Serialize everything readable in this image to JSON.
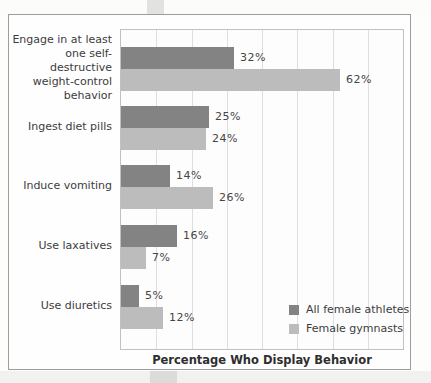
{
  "chart_data": {
    "type": "bar",
    "orientation": "horizontal",
    "xlabel": "Percentage Who Display Behavior",
    "xlim": [
      0,
      80
    ],
    "gridline_interval": 10,
    "grid": true,
    "legend_position": "bottom-right",
    "value_suffix": "%",
    "categories": [
      "Engage in at least one self-destructive weight-control behavior",
      "Ingest diet pills",
      "Induce vomiting",
      "Use laxatives",
      "Use diuretics"
    ],
    "category_lines": [
      [
        "Engage in at least",
        "one self-destructive",
        "weight-control",
        "behavior"
      ],
      [
        "Ingest diet pills"
      ],
      [
        "Induce vomiting"
      ],
      [
        "Use laxatives"
      ],
      [
        "Use diuretics"
      ]
    ],
    "series": [
      {
        "name": "All female athletes",
        "color": "#838383",
        "values": [
          32,
          25,
          14,
          16,
          5
        ]
      },
      {
        "name": "Female gymnasts",
        "color": "#bcbcbc",
        "values": [
          62,
          24,
          26,
          7,
          12
        ]
      }
    ]
  },
  "colors": {
    "text": "#3c3c3c",
    "gridline": "#dedede",
    "plot_border": "#c1c1c1",
    "card_border": "#9d9d9d"
  }
}
